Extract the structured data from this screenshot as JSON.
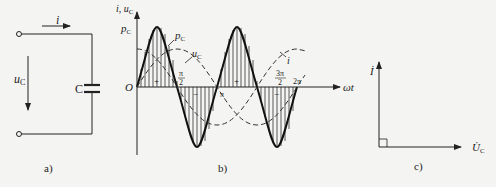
{
  "figure": {
    "panel_a": {
      "caption": "a)",
      "current_label": "i",
      "voltage_label": "u",
      "voltage_sub": "C",
      "capacitor_label": "C"
    },
    "panel_b": {
      "caption": "b)",
      "y_axis_label": "i, u",
      "y_axis_sub": "C",
      "origin_label": "O",
      "x_axis_label": "ωt",
      "pc_axis_label": "p",
      "pc_axis_sub": "C",
      "curve_pc_label": "p",
      "curve_pc_sub": "C",
      "curve_uc_label": "u",
      "curve_uc_sub": "C",
      "curve_i_label": "i",
      "ticks": {
        "pi_over_2_num": "π",
        "pi_over_2_den": "2",
        "pi": "π",
        "three_pi_over_2_num": "3π",
        "three_pi_over_2_den": "2",
        "two_pi": "2π"
      },
      "signs": {
        "plus": "+",
        "minus": "−"
      }
    },
    "panel_c": {
      "caption": "c)",
      "current_phasor": "İ",
      "voltage_phasor": "U̇",
      "voltage_sub": "C"
    },
    "colors": {
      "ink": "#222222",
      "background": "#f4f4f2"
    }
  }
}
